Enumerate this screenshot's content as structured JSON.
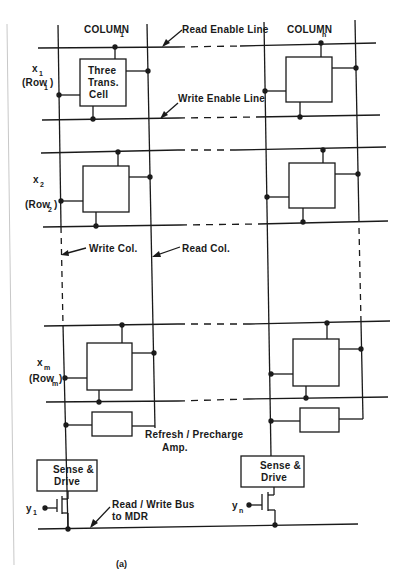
{
  "figure": {
    "caption": "(a)",
    "columns": [
      {
        "label": "COLUMN",
        "subscript": "1"
      },
      {
        "label": "COLUMN",
        "subscript": "n"
      }
    ],
    "rows": [
      {
        "var": "x",
        "var_sub": "1",
        "name": "(Row",
        "name_sub": "1",
        "close": ")"
      },
      {
        "var": "x",
        "var_sub": "2",
        "name": "(Row",
        "name_sub": "2",
        "close": ")"
      },
      {
        "var": "x",
        "var_sub": "m",
        "name": "(Row",
        "name_sub": "m",
        "close": ")"
      }
    ],
    "cell_label": [
      "Three",
      "Trans.",
      "Cell"
    ],
    "annotations": {
      "read_enable_line": "Read Enable Line",
      "write_enable_line": "Write Enable Line",
      "write_col": "Write Col.",
      "read_col": "Read Col.",
      "refresh_amp_line1": "Refresh / Precharge",
      "refresh_amp_line2": "Amp.",
      "rw_bus_line1": "Read / Write  Bus",
      "rw_bus_line2": "to  MDR"
    },
    "sense_drive": [
      "Sense &",
      "Drive"
    ],
    "select_inputs": [
      {
        "var": "y",
        "sub": "1"
      },
      {
        "var": "y",
        "sub": "n"
      }
    ],
    "colors": {
      "ink": "#1a1a1a",
      "page_edge": "#c8c8c8",
      "background": "#ffffff"
    }
  }
}
